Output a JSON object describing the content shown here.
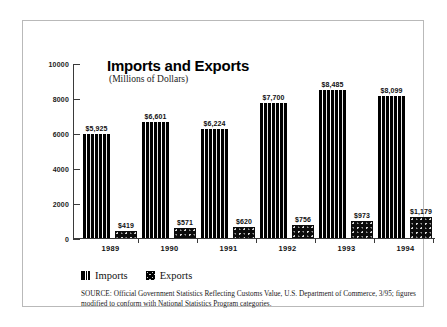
{
  "chart_data": {
    "type": "bar",
    "title": "Imports and Exports",
    "subtitle": "(Millions of Dollars)",
    "xlabel": "",
    "ylabel": "",
    "ylim": [
      0,
      10000
    ],
    "yticks": [
      0,
      2000,
      4000,
      6000,
      8000,
      10000
    ],
    "ytick_labels": [
      "0",
      "2000",
      "4000",
      "6000",
      "8000",
      "10000"
    ],
    "grid": false,
    "legend_position": "bottom-left",
    "categories": [
      "1989",
      "1990",
      "1991",
      "1992",
      "1993",
      "1994"
    ],
    "series": [
      {
        "name": "Imports",
        "swatch": "wavy-stripe-pattern",
        "values": [
          5925,
          6601,
          6224,
          7700,
          8485,
          8099
        ],
        "labels": [
          "$5,925",
          "$6,601",
          "$6,224",
          "$7,700",
          "$8,485",
          "$8,099"
        ]
      },
      {
        "name": "Exports",
        "swatch": "speckled-pattern",
        "values": [
          419,
          571,
          620,
          756,
          973,
          1179
        ],
        "labels": [
          "$419",
          "$571",
          "$620",
          "$756",
          "$973",
          "$1,179"
        ]
      }
    ],
    "source_note": "SOURCE: Official Government Statistics Reflecting Customs Value, U.S. Department of Commerce, 3/95; figures modified to conform with National Statistics Program categories.",
    "colors": {
      "bar_fill": "#000000",
      "axis": "#3a3a3a",
      "text": "#111111",
      "frame": "#b9b9b9",
      "background": "#ffffff"
    }
  }
}
